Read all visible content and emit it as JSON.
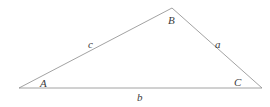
{
  "figure": {
    "type": "triangle-diagram",
    "background_color": "#ffffff",
    "stroke_color": "#8a8a8a",
    "text_color": "#3c3c3c",
    "stroke_width": 0.8,
    "width": 270,
    "height": 107
  },
  "vertices": [
    {
      "id": "A",
      "label": "A",
      "x": 19,
      "y": 88,
      "label_x": 40,
      "label_y": 78
    },
    {
      "id": "B",
      "label": "B",
      "x": 172,
      "y": 8,
      "label_x": 168,
      "label_y": 15
    },
    {
      "id": "C",
      "label": "C",
      "x": 262,
      "y": 88,
      "label_x": 234,
      "label_y": 77
    }
  ],
  "sides": [
    {
      "id": "a",
      "label": "a",
      "from": "B",
      "to": "C",
      "label_x": 215,
      "label_y": 39
    },
    {
      "id": "b",
      "label": "b",
      "from": "A",
      "to": "C",
      "label_x": 137,
      "label_y": 92
    },
    {
      "id": "c",
      "label": "c",
      "from": "A",
      "to": "B",
      "label_x": 88,
      "label_y": 39
    }
  ],
  "polygon_points": "19,88 172,8 262,88"
}
